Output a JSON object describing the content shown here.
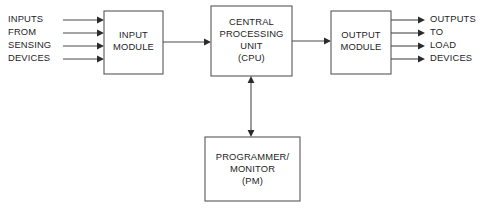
{
  "diagram": {
    "type": "block-diagram",
    "background_color": "#ffffff",
    "line_color": "#58585a",
    "text_color": "#242426",
    "blocks": [
      {
        "id": "input-module",
        "lines": [
          "INPUT",
          "MODULE"
        ],
        "x": 104,
        "y": 11,
        "w": 59,
        "h": 63
      },
      {
        "id": "cpu",
        "lines": [
          "CENTRAL",
          "PROCESSING",
          "UNIT",
          "(CPU)"
        ],
        "x": 211,
        "y": 6,
        "w": 81,
        "h": 70
      },
      {
        "id": "output-module",
        "lines": [
          "OUTPUT",
          "MODULE"
        ],
        "x": 331,
        "y": 11,
        "w": 60,
        "h": 63
      },
      {
        "id": "programmer-monitor",
        "lines": [
          "PROGRAMMER/",
          "MONITOR",
          "(PM)"
        ],
        "x": 205,
        "y": 137,
        "w": 95,
        "h": 64
      }
    ],
    "input_labels": [
      "INPUTS",
      "FROM",
      "SENSING",
      "DEVICES"
    ],
    "output_labels": [
      "OUTPUTS",
      "TO",
      "LOAD",
      "DEVICES"
    ],
    "input_arrows": {
      "x_start": 63,
      "x_end": 104,
      "y_positions": [
        20,
        33,
        46,
        59
      ],
      "label_x": 8,
      "direction": "right"
    },
    "output_arrows": {
      "x_start": 391,
      "x_end": 425,
      "y_positions": [
        20,
        33,
        46,
        59
      ],
      "label_x": 430,
      "direction": "right"
    },
    "connectors": [
      {
        "id": "input-to-cpu",
        "from": "input-module",
        "to": "cpu",
        "orientation": "horizontal",
        "x1": 163,
        "y1": 42,
        "x2": 211,
        "y2": 42,
        "arrow": "end"
      },
      {
        "id": "cpu-to-output",
        "from": "cpu",
        "to": "output-module",
        "orientation": "horizontal",
        "x1": 292,
        "y1": 41,
        "x2": 331,
        "y2": 41,
        "arrow": "end"
      },
      {
        "id": "cpu-to-pm",
        "from": "cpu",
        "to": "programmer-monitor",
        "orientation": "vertical",
        "x1": 251,
        "y1": 76,
        "x2": 251,
        "y2": 137,
        "arrow": "both"
      }
    ]
  }
}
